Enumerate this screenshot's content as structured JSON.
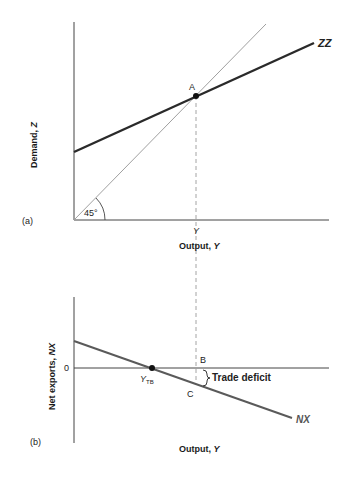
{
  "panel_a": {
    "tag": "(a)",
    "y_axis_title": "Demand, ",
    "y_axis_var": "Z",
    "x_axis_title": "Output, ",
    "x_axis_var": "Y",
    "x_tick": "Y",
    "angle_label": "45°",
    "point_label": "A",
    "curve_label": "ZZ"
  },
  "panel_b": {
    "tag": "(b)",
    "y_axis_title": "Net exports, ",
    "y_axis_var": "NX",
    "y_zero": "0",
    "x_axis_title": "Output, ",
    "x_axis_var": "Y",
    "ytb_main": "Y",
    "ytb_sub": "TB",
    "point_b": "B",
    "point_c": "C",
    "brace_label": "Trade deficit",
    "curve_label": "NX"
  },
  "colors": {
    "axis": "#444444",
    "zz_line": "#2a2a2a",
    "line_45": "#a0a0a0",
    "nx_line": "#5a5a5a",
    "dashed": "#9a9a9a"
  }
}
